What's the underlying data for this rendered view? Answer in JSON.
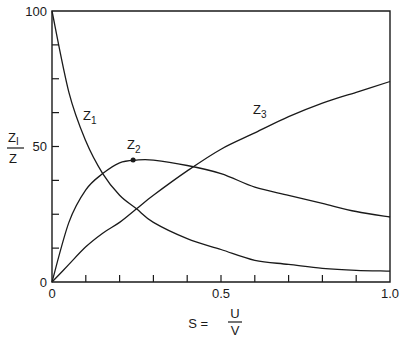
{
  "chart_data": {
    "type": "line",
    "title": "",
    "xlabel": "S = U/V",
    "xlabel_parts": {
      "lhs": "S =",
      "num": "U",
      "den": "V"
    },
    "ylabel": "Z_I/Z",
    "ylabel_parts": {
      "num": "Z",
      "num_sub": "I",
      "den": "Z"
    },
    "xlim": [
      0,
      1.0
    ],
    "ylim": [
      0,
      100
    ],
    "x_tick_labels": [
      "0",
      "0.5",
      "1.0"
    ],
    "x_tick_step": 0.1,
    "y_tick_labels": [
      "0",
      "50",
      "100"
    ],
    "y_tick_step": 12.5,
    "grid": false,
    "x": [
      0,
      0.05,
      0.1,
      0.15,
      0.2,
      0.25,
      0.3,
      0.4,
      0.5,
      0.6,
      0.7,
      0.8,
      0.9,
      1.0
    ],
    "series": [
      {
        "name": "Z1",
        "label_main": "Z",
        "label_sub": "1",
        "values": [
          100,
          70,
          52,
          40,
          32,
          27,
          22,
          16,
          12,
          8,
          6.5,
          5,
          4.3,
          4
        ]
      },
      {
        "name": "Z2",
        "label_main": "Z",
        "label_sub": "2",
        "values": [
          0,
          22,
          34,
          40,
          44,
          45,
          45,
          43,
          40,
          35,
          32,
          29,
          26,
          24
        ],
        "marker": {
          "x": 0.24,
          "y": 45
        }
      },
      {
        "name": "Z3",
        "label_main": "Z",
        "label_sub": "3",
        "values": [
          0,
          6.5,
          13,
          18,
          22,
          27,
          32,
          41,
          49,
          55,
          61,
          66,
          70,
          74
        ]
      }
    ]
  }
}
